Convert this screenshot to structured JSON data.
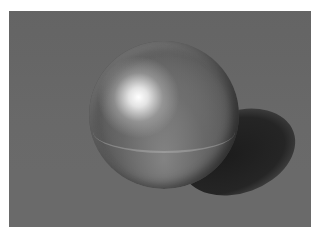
{
  "image": {
    "description": "Rendered reflective chrome sphere on a checkerboard plane with a cast shadow",
    "subjects": [
      "chrome-sphere",
      "checkerboard-floor",
      "shadow"
    ],
    "colors": {
      "checker_dark": "#3e3e3e",
      "checker_light": "#8a8a8a",
      "highlight": "#ffffff",
      "border": "#ffffff"
    }
  }
}
